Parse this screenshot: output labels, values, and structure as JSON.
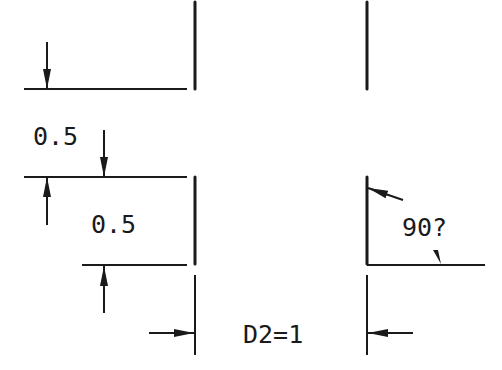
{
  "drawing": {
    "labels": {
      "offset_top": "0.5",
      "offset_bottom": "0.5",
      "distance": "D2=1",
      "angle": "90?"
    },
    "colors": {
      "line": "#1a1a1a",
      "background": "#ffffff"
    }
  }
}
